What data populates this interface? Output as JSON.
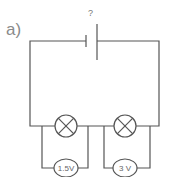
{
  "diagram": {
    "part_label": "a)",
    "battery_label": "?",
    "components": {
      "battery": {
        "type": "cell",
        "voltage": "?"
      },
      "lamps": [
        {
          "id": "lamp-1"
        },
        {
          "id": "lamp-2"
        }
      ],
      "voltmeters": [
        {
          "id": "voltmeter-1",
          "reading": "1.5 V",
          "label": "1.5V"
        },
        {
          "id": "voltmeter-2",
          "reading": "3 V",
          "label": "3 V"
        }
      ]
    },
    "colors": {
      "wire": "#555555",
      "text": "#8a8a8a"
    }
  }
}
